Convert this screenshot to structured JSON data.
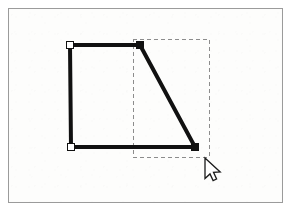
{
  "app": {
    "title": "Vector Path Node Editing"
  },
  "canvas": {
    "name": "drawing-canvas",
    "width": 292,
    "height": 212,
    "background_color": "#fdfdfc",
    "frame": {
      "name": "canvas-frame",
      "x": 8,
      "y": 8,
      "width": 275,
      "height": 195,
      "border_color": "#9b9b9b",
      "border_width": 1
    }
  },
  "shape": {
    "name": "trapezoid-path",
    "type": "open-polyline",
    "stroke_color": "#111111",
    "stroke_width": 4,
    "fill": "none",
    "points": "70,45 140,45 195,147 71,147 70,45",
    "segments": [
      {
        "name": "top-edge",
        "x1": 70,
        "y1": 45,
        "x2": 140,
        "y2": 45
      },
      {
        "name": "diagonal-edge",
        "x1": 140,
        "y1": 45,
        "x2": 195,
        "y2": 147
      },
      {
        "name": "bottom-edge",
        "x1": 195,
        "y1": 147,
        "x2": 71,
        "y2": 147
      },
      {
        "name": "left-edge",
        "x1": 71,
        "y1": 147,
        "x2": 70,
        "y2": 45
      }
    ]
  },
  "nodes": [
    {
      "name": "node-top-left",
      "label": "Top left anchor",
      "x": 70,
      "y": 45,
      "size": 7,
      "state": "unselected",
      "fill_color": "#ffffff",
      "stroke_color": "#111111"
    },
    {
      "name": "node-top-right",
      "label": "Top right anchor",
      "x": 140,
      "y": 45,
      "size": 7,
      "state": "selected",
      "fill_color": "#111111",
      "stroke_color": "#111111"
    },
    {
      "name": "node-bottom-right",
      "label": "Bottom right anchor",
      "x": 195,
      "y": 147,
      "size": 7,
      "state": "selected",
      "fill_color": "#111111",
      "stroke_color": "#111111"
    },
    {
      "name": "node-bottom-left",
      "label": "Bottom left anchor",
      "x": 71,
      "y": 147,
      "size": 7,
      "state": "unselected",
      "fill_color": "#ffffff",
      "stroke_color": "#111111"
    }
  ],
  "selection_marquee": {
    "name": "selection-marquee",
    "label": "Rubber band selection rectangle",
    "x": 133,
    "y": 39,
    "width": 76,
    "height": 118,
    "stroke_color": "#8c8c8c",
    "stroke_width": 1,
    "dash_pattern": "4 3",
    "fill": "none"
  },
  "cursor": {
    "name": "mouse-pointer",
    "label": "Arrow pointer",
    "tip_x": 205,
    "tip_y": 158,
    "fill_color": "#ffffff",
    "stroke_color": "#1a1a1a"
  }
}
